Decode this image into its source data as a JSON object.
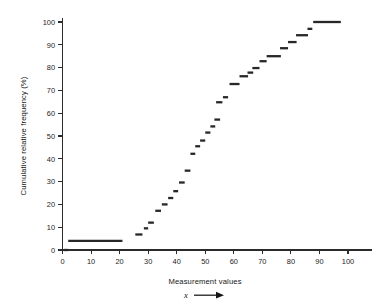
{
  "chart_data": {
    "type": "line",
    "subtype": "step-ogive",
    "title": "",
    "xlabel": "Measurement values",
    "ylabel": "Cumulative relative frequency (%)",
    "x_variable_symbol": "x",
    "x_arrow": "→",
    "xlim": [
      0,
      100
    ],
    "ylim": [
      0,
      100
    ],
    "x_ticks": [
      0,
      10,
      20,
      30,
      40,
      50,
      60,
      70,
      80,
      90,
      100
    ],
    "y_ticks": [
      0,
      10,
      20,
      30,
      40,
      50,
      60,
      70,
      80,
      90,
      100
    ],
    "x_tick_labels": [
      "0",
      "10",
      "20",
      "30",
      "40",
      "50",
      "60",
      "70",
      "80",
      "90",
      "100"
    ],
    "y_tick_labels": [
      "0",
      "10",
      "20",
      "30",
      "40",
      "50",
      "60",
      "70",
      "80",
      "90",
      "100"
    ],
    "grid": false,
    "legend": "none",
    "series": [
      {
        "name": "Cumulative relative frequency",
        "color": "#272727",
        "style": "horizontal step segments",
        "segments": [
          {
            "x0": 0.5,
            "x1": 2.0,
            "y": 0.0
          },
          {
            "x0": 2.0,
            "x1": 21.0,
            "y": 4.0
          },
          {
            "x0": 25.5,
            "x1": 28.0,
            "y": 6.8
          },
          {
            "x0": 28.5,
            "x1": 30.0,
            "y": 9.5
          },
          {
            "x0": 30.0,
            "x1": 32.0,
            "y": 12.0
          },
          {
            "x0": 32.5,
            "x1": 34.5,
            "y": 17.2
          },
          {
            "x0": 34.8,
            "x1": 36.8,
            "y": 20.0
          },
          {
            "x0": 37.0,
            "x1": 38.8,
            "y": 22.8
          },
          {
            "x0": 38.8,
            "x1": 40.5,
            "y": 25.8
          },
          {
            "x0": 40.8,
            "x1": 42.8,
            "y": 29.6
          },
          {
            "x0": 42.8,
            "x1": 44.8,
            "y": 34.8
          },
          {
            "x0": 44.8,
            "x1": 46.5,
            "y": 42.2
          },
          {
            "x0": 46.5,
            "x1": 48.2,
            "y": 45.5
          },
          {
            "x0": 48.2,
            "x1": 50.0,
            "y": 48.0
          },
          {
            "x0": 50.0,
            "x1": 51.8,
            "y": 51.5
          },
          {
            "x0": 51.8,
            "x1": 53.5,
            "y": 54.2
          },
          {
            "x0": 53.2,
            "x1": 55.2,
            "y": 57.2
          },
          {
            "x0": 53.8,
            "x1": 56.0,
            "y": 64.8
          },
          {
            "x0": 56.2,
            "x1": 58.0,
            "y": 67.0
          },
          {
            "x0": 58.5,
            "x1": 62.0,
            "y": 72.8
          },
          {
            "x0": 62.0,
            "x1": 65.0,
            "y": 76.2
          },
          {
            "x0": 64.8,
            "x1": 66.8,
            "y": 77.8
          },
          {
            "x0": 66.5,
            "x1": 69.0,
            "y": 79.8
          },
          {
            "x0": 69.0,
            "x1": 71.5,
            "y": 82.8
          },
          {
            "x0": 71.5,
            "x1": 76.5,
            "y": 85.0
          },
          {
            "x0": 76.2,
            "x1": 79.0,
            "y": 88.5
          },
          {
            "x0": 79.0,
            "x1": 82.0,
            "y": 91.2
          },
          {
            "x0": 81.8,
            "x1": 86.0,
            "y": 94.2
          },
          {
            "x0": 85.8,
            "x1": 87.5,
            "y": 97.0
          },
          {
            "x0": 87.8,
            "x1": 97.5,
            "y": 100.0
          }
        ]
      }
    ]
  },
  "colors": {
    "axis": "#2b2b2b",
    "data": "#272727",
    "background": "#ffffff",
    "text": "#151515"
  }
}
